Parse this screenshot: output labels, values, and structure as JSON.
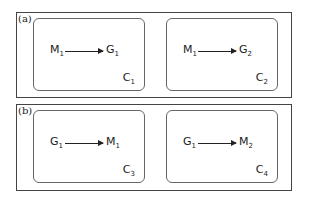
{
  "panels": [
    {
      "label": "(a)",
      "boxes": [
        {
          "source": "M",
          "source_sub": "1",
          "target": "G",
          "target_sub": "1",
          "context": "C",
          "context_sub": "1"
        },
        {
          "source": "M",
          "source_sub": "1",
          "target": "G",
          "target_sub": "2",
          "context": "C",
          "context_sub": "2"
        }
      ]
    },
    {
      "label": "(b)",
      "boxes": [
        {
          "source": "G",
          "source_sub": "1",
          "target": "M",
          "target_sub": "1",
          "context": "C",
          "context_sub": "3"
        },
        {
          "source": "G",
          "source_sub": "1",
          "target": "M",
          "target_sub": "2",
          "context": "C",
          "context_sub": "4"
        }
      ]
    }
  ],
  "colors": {
    "line": "#444444",
    "box_border": "#666666",
    "text": "#222222"
  }
}
